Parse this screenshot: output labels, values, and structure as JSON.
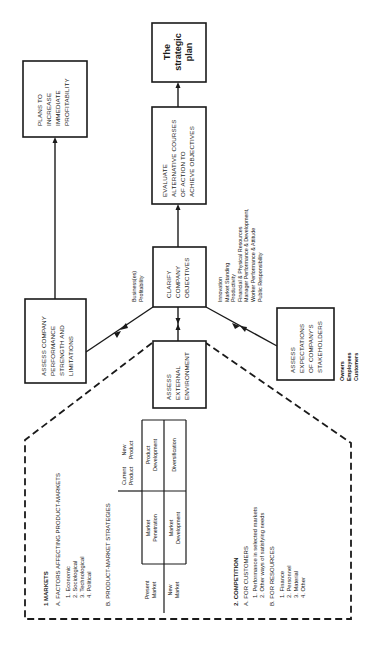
{
  "diagram": {
    "orientation": "rotated -90deg (text reads bottom-to-top)",
    "boxes": {
      "strategic_plan": {
        "lines": [
          "The",
          "strategic",
          "plan"
        ]
      },
      "evaluate": {
        "lines": [
          "EVALUATE",
          "ALTERNATIVE  COURSES",
          "OF  ACTION  TO",
          "ACHIEVE  OBJECTIVES"
        ]
      },
      "plans_profitability": {
        "lines": [
          "PLANS  TO",
          "INCREASE",
          "IMMEDIATE",
          "PROFITABILITY"
        ]
      },
      "clarify": {
        "lines": [
          "CLARIFY",
          "COMPANY",
          "OBJECTIVES"
        ]
      },
      "assess_performance": {
        "lines": [
          "ASSESS  COMPANY",
          "PERFORMANCE",
          "STRENGTH  AND",
          "LIMITATIONS"
        ]
      },
      "assess_environment": {
        "lines": [
          "ASSESS",
          "EXTERNAL",
          "ENVIRONMENT"
        ]
      },
      "assess_stakeholders": {
        "lines": [
          "ASSESS",
          "EXPECTATIONS",
          "OF  COMPANY'S",
          "STAKEHOLDERS"
        ]
      }
    },
    "annotations": {
      "business_profitability": [
        "Business(es)",
        "Profitability"
      ],
      "objectives_list": [
        "Innovation",
        "Market Standing",
        "Productivity",
        "Financial & Physical Resources",
        "Manager Performance & Development,",
        "Worker Performance & Attitude",
        "Public Responsibility"
      ],
      "stakeholders_list": [
        "Owners",
        "Employees",
        "Customers"
      ]
    },
    "environment_detail": {
      "markets": {
        "heading": "1  MARKETS",
        "factors_heading": "A.  FACTORS  AFFECTING  PRODUCT-MARKETS",
        "factors": [
          "1.  Economic",
          "2.  Sociological",
          "3.  Technological",
          "4.  Political"
        ],
        "strategies_heading": "B.  PRODUCT-MARKET  STRATEGIES",
        "matrix": {
          "col_headers": [
            [
              "Current",
              "Product"
            ],
            [
              "New",
              "Product"
            ]
          ],
          "row_headers": [
            [
              "Present",
              "Market"
            ],
            [
              "New",
              "Market"
            ]
          ],
          "cells": [
            [
              [
                "Market",
                "Penetration"
              ],
              [
                "Product",
                "Development"
              ]
            ],
            [
              [
                "Market",
                "Development"
              ],
              [
                "Diversification"
              ]
            ]
          ]
        }
      },
      "competition": {
        "heading": "2.  COMPETITION",
        "customers_heading": "A.  FOR  CUSTOMERS",
        "customers": [
          "1.  Performance in selected markets",
          "2.  Other ways of satisfying needs"
        ],
        "resources_heading": "B.  FOR  RESOURCES",
        "resources": [
          "1.  Finance",
          "2.  Personnel",
          "3.  Material",
          "4.  Other"
        ]
      }
    }
  }
}
